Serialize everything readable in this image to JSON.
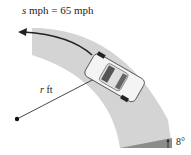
{
  "figure": {
    "speed_label_var": "s",
    "speed_label_rest": " mph = 65 mph",
    "radius_label_var": "r",
    "radius_label_rest": " ft",
    "bank_angle_label": "8°"
  },
  "colors": {
    "road": "#d2d2d2",
    "bank": "#8a8a8a",
    "arrow": "#222222",
    "car": "#f2f2f2"
  }
}
